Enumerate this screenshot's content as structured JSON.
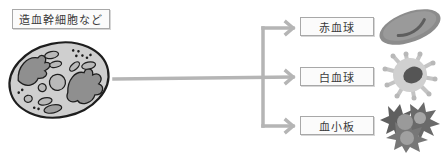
{
  "diagram": {
    "source": {
      "label": "造血幹細胞など",
      "icon": "stem-cell-icon"
    },
    "targets": [
      {
        "label": "赤血球",
        "icon": "red-blood-cell-icon"
      },
      {
        "label": "白血球",
        "icon": "white-blood-cell-icon"
      },
      {
        "label": "血小板",
        "icon": "platelet-icon"
      }
    ],
    "colors": {
      "arrow": "#b5b5b5",
      "box_border": "#a8a8a8",
      "text": "#3a3a3a",
      "cell_fill": "#a0a0a0",
      "cell_dark": "#6e6e6e",
      "cell_light": "#d2d2d2"
    }
  }
}
